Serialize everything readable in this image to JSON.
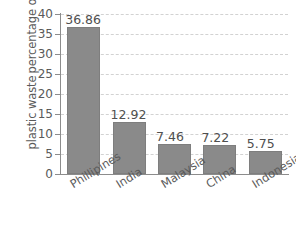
{
  "chart_data": {
    "type": "bar",
    "title": "",
    "xlabel": "",
    "ylabel": "percentage of global plastic waste",
    "ylabel_lines": [
      "percentage of global",
      "plastic waste"
    ],
    "categories": [
      "Phillipines",
      "India",
      "Malaysia",
      "China",
      "Indonesia"
    ],
    "values": [
      36.86,
      12.92,
      7.46,
      7.22,
      5.75
    ],
    "value_labels": [
      "36.86",
      "12.92",
      "7.46",
      "7.22",
      "5.75"
    ],
    "ylim": [
      0,
      40
    ],
    "ytick_step": 5,
    "yticks": [
      40,
      35,
      30,
      25,
      20,
      15,
      10,
      5,
      0
    ],
    "ytick_labels": [
      "40",
      "35",
      "30",
      "25",
      "20",
      "15",
      "10",
      "5",
      "0"
    ],
    "grid": true,
    "grid_style": "dashed",
    "legend": false,
    "bar_color": "#8a8a8a",
    "grid_color": "#d2d2d2",
    "axis_color": "#8c8c8c",
    "text_color": "#5a5a5a",
    "background": "#ffffff"
  }
}
